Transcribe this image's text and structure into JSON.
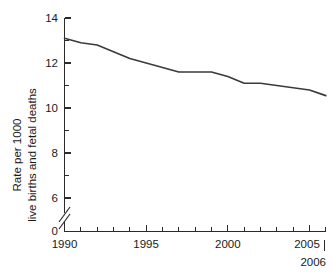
{
  "chart_data": {
    "type": "line",
    "title": "",
    "xlabel": "",
    "ylabel_line1": "Rate per 1000",
    "ylabel_line2": "live births and fetal deaths",
    "x": [
      1990,
      1991,
      1992,
      1993,
      1994,
      1995,
      1996,
      1997,
      1998,
      1999,
      2000,
      2001,
      2002,
      2003,
      2004,
      2005,
      2006
    ],
    "values": [
      13.1,
      12.9,
      12.8,
      12.5,
      12.2,
      12.0,
      11.8,
      11.6,
      11.6,
      11.6,
      11.4,
      11.1,
      11.1,
      11.0,
      10.9,
      10.8,
      10.55
    ],
    "series": [
      {
        "name": "Rate per 1000 live births and fetal deaths",
        "values": [
          13.1,
          12.9,
          12.8,
          12.5,
          12.2,
          12.0,
          11.8,
          11.6,
          11.6,
          11.6,
          11.4,
          11.1,
          11.1,
          11.0,
          10.9,
          10.8,
          10.55
        ]
      }
    ],
    "xlim": [
      1990,
      2006
    ],
    "ylim": [
      0,
      14
    ],
    "y_axis_break": true,
    "y_break_between": [
      0,
      6
    ],
    "grid": false,
    "legend": "none",
    "y_ticks": [
      {
        "value": 0,
        "label": "0"
      },
      {
        "value": 6,
        "label": "6"
      },
      {
        "value": 8,
        "label": "8"
      },
      {
        "value": 10,
        "label": "10"
      },
      {
        "value": 12,
        "label": "12"
      },
      {
        "value": 14,
        "label": "14"
      }
    ],
    "x_ticks_major": [
      {
        "value": 1990,
        "label": "1990"
      },
      {
        "value": 1995,
        "label": "1995"
      },
      {
        "value": 2000,
        "label": "2000"
      },
      {
        "value": 2005,
        "label": "2005"
      }
    ],
    "x_ticks_minor": [
      1991,
      1992,
      1993,
      1994,
      1996,
      1997,
      1998,
      1999,
      2001,
      2002,
      2003,
      2004,
      2006
    ],
    "x_end_label": "2006",
    "colors": {
      "line": "#3a3a3a",
      "axis": "#2b2b2b",
      "text": "#1a1a1a",
      "background": "#ffffff"
    }
  }
}
